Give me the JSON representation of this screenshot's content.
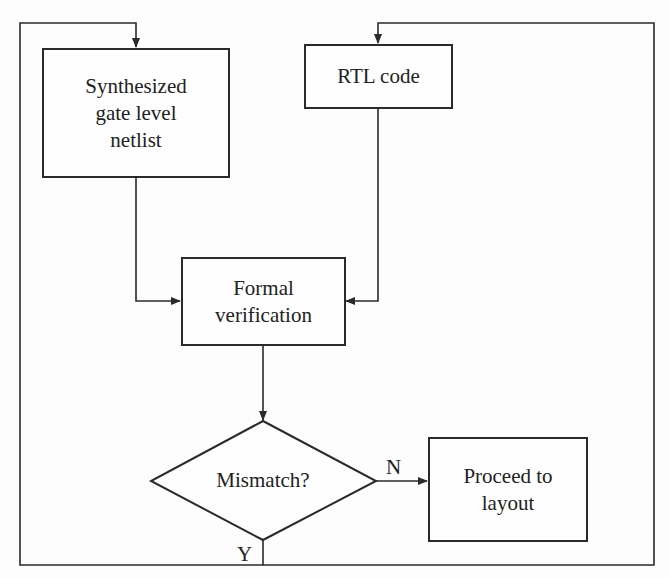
{
  "diagram": {
    "type": "flowchart",
    "nodes": {
      "synthesized_netlist": {
        "lines": [
          "Synthesized",
          "gate level",
          "netlist"
        ],
        "text": "Synthesized gate level netlist"
      },
      "rtl_code": {
        "text": "RTL code"
      },
      "formal_verification": {
        "lines": [
          "Formal",
          "verification"
        ],
        "text": "Formal verification"
      },
      "mismatch": {
        "text": "Mismatch?",
        "shape": "diamond"
      },
      "proceed_to_layout": {
        "lines": [
          "Proceed to",
          "layout"
        ],
        "text": "Proceed to layout"
      }
    },
    "edge_labels": {
      "no": "N",
      "yes": "Y"
    },
    "edges": [
      {
        "from": "synthesized_netlist",
        "to": "formal_verification"
      },
      {
        "from": "rtl_code",
        "to": "formal_verification"
      },
      {
        "from": "formal_verification",
        "to": "mismatch"
      },
      {
        "from": "mismatch",
        "to": "proceed_to_layout",
        "label": "N"
      },
      {
        "from": "mismatch",
        "to": "synthesized_netlist",
        "label": "Y"
      },
      {
        "from": "mismatch",
        "to": "rtl_code",
        "label": "Y"
      }
    ],
    "colors": {
      "line": "#2a2a2a",
      "background": "#fdfdfd"
    }
  }
}
